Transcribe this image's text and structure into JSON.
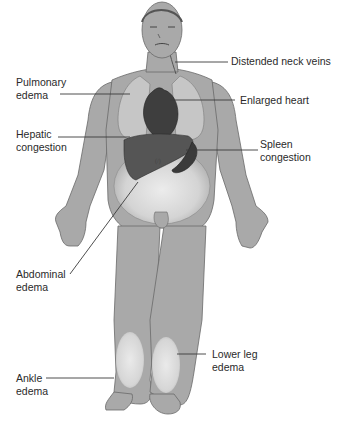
{
  "diagram": {
    "colors": {
      "background": "#ffffff",
      "body": "#a9a9a9",
      "body_outline": "#6a6a6a",
      "lung": "#c6c6c6",
      "organ_dark": "#3e3e3e",
      "liver": "#555555",
      "edema_highlight": "#e2e2e2",
      "leader_line": "#3a3a3a",
      "text": "#2a2a2a"
    },
    "labels": {
      "neck_veins": "Distended neck veins",
      "pulmonary": "Pulmonary\nedema",
      "heart": "Enlarged heart",
      "hepatic": "Hepatic\ncongestion",
      "spleen": "Spleen\ncongestion",
      "abdominal": "Abdominal\nedema",
      "lower_leg": "Lower leg\nedema",
      "ankle": "Ankle\nedema"
    }
  }
}
